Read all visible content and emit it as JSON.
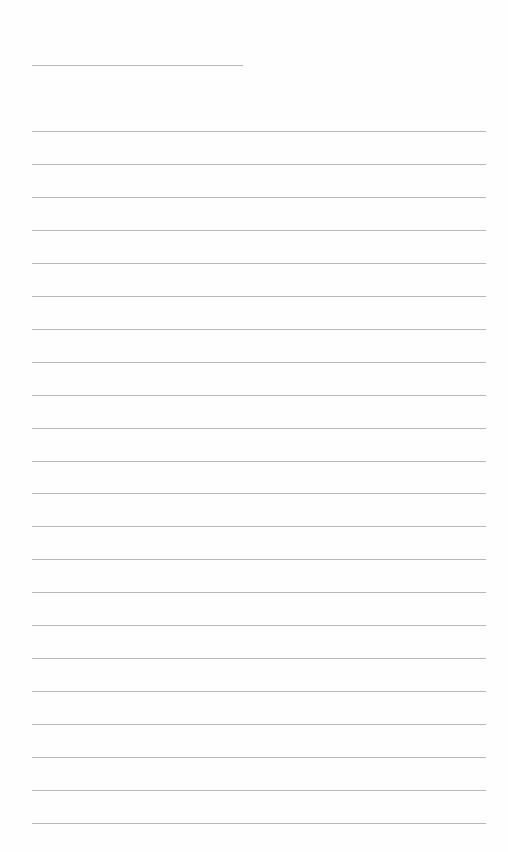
{
  "document": {
    "type": "lined-writing-sheet",
    "name_line": {
      "x": 32,
      "y": 65,
      "width": 211
    },
    "ruled_lines": {
      "count": 22,
      "start_y": 131,
      "spacing": 32.95,
      "x": 32,
      "width": 454
    },
    "colors": {
      "paper": "#fefefe",
      "line": "#b8b8b8"
    }
  }
}
